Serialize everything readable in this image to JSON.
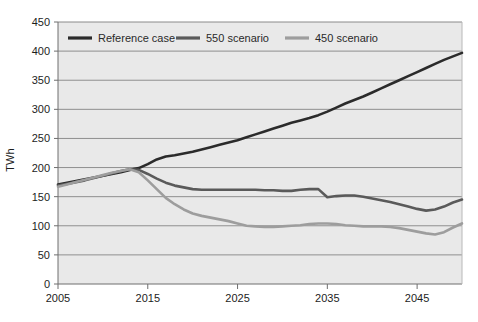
{
  "chart_data": {
    "type": "line",
    "title": "",
    "subtitle": "",
    "xlabel": "",
    "ylabel": "TWh",
    "xlim": [
      2005,
      2050
    ],
    "ylim": [
      0,
      450
    ],
    "xticks": [
      2005,
      2015,
      2025,
      2035,
      2045
    ],
    "yticks": [
      0,
      50,
      100,
      150,
      200,
      250,
      300,
      350,
      400,
      450
    ],
    "grid": "horizontal",
    "legend_position": "top-inside",
    "plot_background": "#e9e9e9",
    "series": [
      {
        "name": "Reference case",
        "color": "#2b2b2b",
        "x": [
          2005,
          2006,
          2007,
          2008,
          2009,
          2010,
          2011,
          2012,
          2013,
          2014,
          2015,
          2016,
          2017,
          2018,
          2019,
          2020,
          2021,
          2022,
          2023,
          2024,
          2025,
          2026,
          2027,
          2028,
          2029,
          2030,
          2031,
          2032,
          2033,
          2034,
          2035,
          2036,
          2037,
          2038,
          2039,
          2040,
          2041,
          2042,
          2043,
          2044,
          2045,
          2046,
          2047,
          2048,
          2049,
          2050
        ],
        "values": [
          171,
          174,
          177,
          180,
          183,
          186,
          189,
          192,
          196,
          199,
          206,
          214,
          219,
          221,
          224,
          227,
          231,
          235,
          239,
          243,
          247,
          252,
          257,
          262,
          267,
          272,
          277,
          281,
          285,
          290,
          296,
          303,
          310,
          316,
          322,
          329,
          336,
          343,
          350,
          357,
          364,
          371,
          378,
          385,
          391,
          397
        ]
      },
      {
        "name": "550 scenario",
        "color": "#5a5a5a",
        "x": [
          2005,
          2006,
          2007,
          2008,
          2009,
          2010,
          2011,
          2012,
          2013,
          2014,
          2015,
          2016,
          2017,
          2018,
          2019,
          2020,
          2021,
          2022,
          2023,
          2024,
          2025,
          2026,
          2027,
          2028,
          2029,
          2030,
          2031,
          2032,
          2033,
          2034,
          2035,
          2036,
          2037,
          2038,
          2039,
          2040,
          2041,
          2042,
          2043,
          2044,
          2045,
          2046,
          2047,
          2048,
          2049,
          2050
        ],
        "values": [
          169,
          172,
          175,
          178,
          182,
          186,
          190,
          194,
          197,
          196,
          189,
          181,
          174,
          169,
          166,
          163,
          162,
          162,
          162,
          162,
          162,
          162,
          162,
          161,
          161,
          160,
          160,
          162,
          163,
          163,
          149,
          151,
          152,
          152,
          150,
          147,
          144,
          141,
          137,
          133,
          129,
          126,
          128,
          133,
          140,
          145
        ]
      },
      {
        "name": "450 scenario",
        "color": "#9d9d9d",
        "x": [
          2005,
          2006,
          2007,
          2008,
          2009,
          2010,
          2011,
          2012,
          2013,
          2014,
          2015,
          2016,
          2017,
          2018,
          2019,
          2020,
          2021,
          2022,
          2023,
          2024,
          2025,
          2026,
          2027,
          2028,
          2029,
          2030,
          2031,
          2032,
          2033,
          2034,
          2035,
          2036,
          2037,
          2038,
          2039,
          2040,
          2041,
          2042,
          2043,
          2044,
          2045,
          2046,
          2047,
          2048,
          2049,
          2050
        ],
        "values": [
          167,
          171,
          175,
          179,
          183,
          187,
          191,
          194,
          197,
          192,
          178,
          163,
          148,
          137,
          128,
          121,
          117,
          114,
          111,
          108,
          104,
          100,
          99,
          98,
          98,
          99,
          100,
          101,
          103,
          104,
          104,
          103,
          101,
          100,
          99,
          99,
          99,
          98,
          96,
          93,
          90,
          87,
          85,
          89,
          97,
          104
        ]
      }
    ]
  },
  "legend": {
    "items": [
      {
        "label": "Reference case",
        "color": "#2b2b2b"
      },
      {
        "label": "550 scenario",
        "color": "#5a5a5a"
      },
      {
        "label": "450 scenario",
        "color": "#9d9d9d"
      }
    ]
  },
  "axes": {
    "y_title": "TWh",
    "y_tick_labels": [
      "450",
      "400",
      "350",
      "300",
      "250",
      "200",
      "150",
      "100",
      "50",
      "0"
    ],
    "x_tick_labels": [
      "2005",
      "2015",
      "2025",
      "2035",
      "2045"
    ]
  }
}
